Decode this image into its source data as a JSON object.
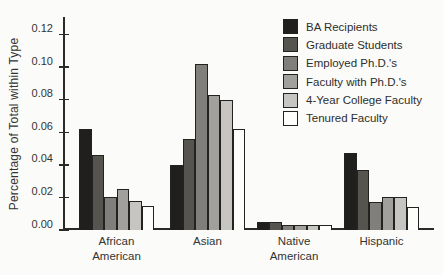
{
  "figure": {
    "background": "#fbfbf9",
    "axis_color": "#2a2a28",
    "text_color": "#333331"
  },
  "chart_data": {
    "type": "bar",
    "title": "",
    "xlabel": "",
    "ylabel": "Percentage of Total within Type",
    "ylim": [
      0,
      0.13
    ],
    "grid": false,
    "legend_position": "upper right",
    "yticks": [
      {
        "value": 0.0,
        "label": "0.00"
      },
      {
        "value": 0.02,
        "label": "0.02"
      },
      {
        "value": 0.04,
        "label": "0.04"
      },
      {
        "value": 0.06,
        "label": "0.06"
      },
      {
        "value": 0.08,
        "label": "0.08"
      },
      {
        "value": 0.1,
        "label": "0.10"
      },
      {
        "value": 0.12,
        "label": "0.12"
      }
    ],
    "categories": [
      "African American",
      "Asian",
      "Native American",
      "Hispanic"
    ],
    "category_label_lines": [
      "African\nAmerican",
      "Asian",
      "Native\nAmerican",
      "Hispanic"
    ],
    "series": [
      {
        "name": "BA Recipients",
        "color": "#201f1d",
        "values": [
          0.062,
          0.04,
          0.005,
          0.047
        ]
      },
      {
        "name": "Graduate Students",
        "color": "#55544f",
        "values": [
          0.046,
          0.056,
          0.005,
          0.037
        ]
      },
      {
        "name": "Employed Ph.D.'s",
        "color": "#807f7b",
        "values": [
          0.02,
          0.102,
          0.003,
          0.017
        ]
      },
      {
        "name": "Faculty with Ph.D.'s",
        "color": "#a1a09c",
        "values": [
          0.025,
          0.083,
          0.003,
          0.02
        ]
      },
      {
        "name": "4-Year College Faculty",
        "color": "#c6c5c1",
        "values": [
          0.018,
          0.08,
          0.003,
          0.02
        ]
      },
      {
        "name": "Tenured Faculty",
        "color": "#fdfdfb",
        "values": [
          0.015,
          0.062,
          0.003,
          0.014
        ]
      }
    ]
  }
}
